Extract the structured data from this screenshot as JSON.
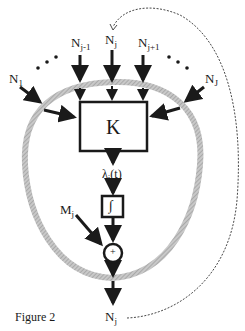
{
  "figure": {
    "caption": "Figure 2",
    "kernel_label": "K",
    "integrator_symbol": "∫",
    "sum_symbol": "+",
    "rate_label": {
      "base": "λ",
      "sub": "j",
      "suffix": "(t)"
    },
    "external_input": {
      "base": "M",
      "sub": "j"
    },
    "output": {
      "base": "N",
      "sub": "j"
    },
    "inputs": [
      {
        "base": "N",
        "sub": "1"
      },
      {
        "base": "N",
        "sub": "j-1"
      },
      {
        "base": "N",
        "sub": "j"
      },
      {
        "base": "N",
        "sub": "j+1"
      },
      {
        "base": "N",
        "sub": "J"
      }
    ],
    "ellipsis": "• • •",
    "colors": {
      "ink": "#1a1a1a",
      "ring": "#b0b0b0"
    }
  }
}
